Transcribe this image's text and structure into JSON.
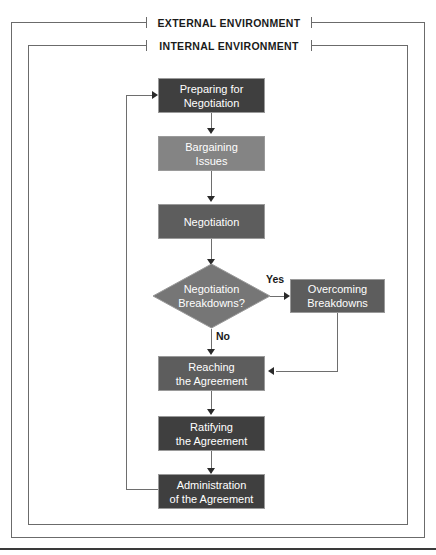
{
  "diagram": {
    "environments": [
      {
        "id": "external",
        "label": "EXTERNAL ENVIRONMENT"
      },
      {
        "id": "internal",
        "label": "INTERNAL ENVIRONMENT"
      }
    ],
    "nodes": [
      {
        "id": "preparing",
        "label": "Preparing for\nNegotiation",
        "line1": "Preparing for",
        "line2": "Negotiation",
        "shape": "process",
        "tone": "dark",
        "tone_color": "#3f3f3f"
      },
      {
        "id": "bargaining",
        "label": "Bargaining\nIssues",
        "line1": "Bargaining",
        "line2": "Issues",
        "shape": "process",
        "tone": "light",
        "tone_color": "#848484"
      },
      {
        "id": "negotiation",
        "label": "Negotiation",
        "line1": "Negotiation",
        "line2": "",
        "shape": "process",
        "tone": "mid",
        "tone_color": "#5d5d5d"
      },
      {
        "id": "breakdowns",
        "label": "Negotiation\nBreakdowns?",
        "line1": "Negotiation",
        "line2": "Breakdowns?",
        "shape": "decision",
        "tone": "mid",
        "tone_color": "#767676"
      },
      {
        "id": "overcoming",
        "label": "Overcoming\nBreakdowns",
        "line1": "Overcoming",
        "line2": "Breakdowns",
        "shape": "process",
        "tone": "mid",
        "tone_color": "#5d5d5d"
      },
      {
        "id": "reaching",
        "label": "Reaching\nthe Agreement",
        "line1": "Reaching",
        "line2": "the Agreement",
        "shape": "process",
        "tone": "mid",
        "tone_color": "#5d5d5d"
      },
      {
        "id": "ratifying",
        "label": "Ratifying\nthe Agreement",
        "line1": "Ratifying",
        "line2": "the Agreement",
        "shape": "process",
        "tone": "dark",
        "tone_color": "#3f3f3f"
      },
      {
        "id": "administration",
        "label": "Administration\nof the Agreement",
        "line1": "Administration",
        "line2": "of the Agreement",
        "shape": "process",
        "tone": "dark",
        "tone_color": "#3f3f3f"
      }
    ],
    "edge_labels": [
      {
        "id": "yes",
        "label": "Yes"
      },
      {
        "id": "no",
        "label": "No"
      }
    ],
    "colors": {
      "frame_line": "#6b6b6b",
      "connector_line": "#6e6e6e",
      "arrow_head": "#2a2a2a",
      "node_text": "#ffffff",
      "label_text": "#1a1a1a",
      "background": "#ffffff"
    }
  }
}
